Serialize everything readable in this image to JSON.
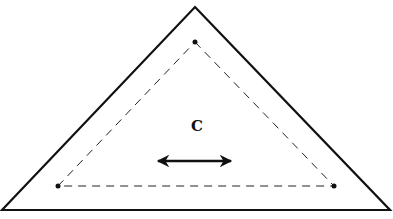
{
  "diagram": {
    "label": "C",
    "label_pos": [
      197,
      126
    ],
    "colors": {
      "stroke": "#111111",
      "background": "#ffffff"
    },
    "outer_triangle": {
      "points": [
        [
          195,
          7
        ],
        [
          390,
          210
        ],
        [
          2,
          210
        ]
      ],
      "style": "solid"
    },
    "inner_triangle": {
      "points": [
        [
          195,
          42
        ],
        [
          334,
          186
        ],
        [
          58,
          186
        ]
      ],
      "style": "dashed"
    },
    "vertex_dots": [
      [
        195,
        42
      ],
      [
        334,
        186
      ],
      [
        58,
        186
      ]
    ],
    "arrow": {
      "from": [
        155,
        161
      ],
      "to": [
        234,
        161
      ],
      "type": "double-headed",
      "direction": "horizontal"
    }
  }
}
